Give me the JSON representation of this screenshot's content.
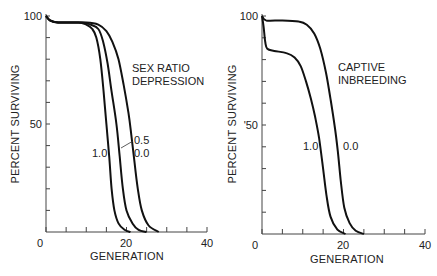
{
  "chart_data": [
    {
      "type": "line",
      "title": "SEX RATIO DEPRESSION",
      "annotation": [
        "SEX RATIO",
        "DEPRESSION"
      ],
      "xlabel": "GENERATION",
      "ylabel": "PERCENT SURVIVING",
      "xlim": [
        0,
        40
      ],
      "ylim": [
        0,
        100
      ],
      "xticks": [
        0,
        20,
        40
      ],
      "x_minor_ticks": [
        5,
        10,
        15,
        25,
        30,
        35
      ],
      "yticks": [
        50,
        100
      ],
      "y_minor_ticks": [
        10,
        20,
        30,
        40,
        60,
        70,
        80,
        90
      ],
      "grid": false,
      "series": [
        {
          "name": "1.0",
          "points": [
            [
              0,
              100
            ],
            [
              1,
              98
            ],
            [
              3,
              97
            ],
            [
              8,
              97
            ],
            [
              10,
              96
            ],
            [
              11.5,
              94
            ],
            [
              12.5,
              90
            ],
            [
              13.5,
              80
            ],
            [
              14.3,
              65
            ],
            [
              15,
              50
            ],
            [
              15.7,
              35
            ],
            [
              16.3,
              20
            ],
            [
              17,
              10
            ],
            [
              18,
              4
            ],
            [
              19.5,
              1
            ],
            [
              21,
              0
            ]
          ]
        },
        {
          "name": "0.5",
          "points": [
            [
              0,
              100
            ],
            [
              1,
              98
            ],
            [
              3,
              97
            ],
            [
              9,
              97
            ],
            [
              11,
              96
            ],
            [
              13,
              94
            ],
            [
              14.2,
              88
            ],
            [
              15.3,
              78
            ],
            [
              16.3,
              65
            ],
            [
              17.5,
              50
            ],
            [
              18.3,
              35
            ],
            [
              19.1,
              20
            ],
            [
              20,
              10
            ],
            [
              21.5,
              4
            ],
            [
              23,
              1
            ],
            [
              25,
              0
            ]
          ]
        },
        {
          "name": "0.0",
          "points": [
            [
              0,
              100
            ],
            [
              1,
              98
            ],
            [
              3,
              97
            ],
            [
              10,
              97
            ],
            [
              13,
              96
            ],
            [
              15,
              93
            ],
            [
              16.5,
              88
            ],
            [
              18,
              80
            ],
            [
              19.3,
              68
            ],
            [
              20.5,
              55
            ],
            [
              21.2,
              45
            ],
            [
              22,
              32
            ],
            [
              22.8,
              20
            ],
            [
              23.8,
              10
            ],
            [
              25.5,
              3
            ],
            [
              28,
              0
            ]
          ]
        }
      ],
      "series_labels": [
        {
          "name": "1.0",
          "label": "1.0"
        },
        {
          "name": "0.5",
          "label": "0.5"
        },
        {
          "name": "0.0",
          "label": "0.0"
        }
      ]
    },
    {
      "type": "line",
      "title": "CAPTIVE INBREEDING",
      "annotation": [
        "CAPTIVE",
        "INBREEDING"
      ],
      "xlabel": "GENERATION",
      "ylabel": "PERCENT SURVIVING",
      "xlim": [
        0,
        40
      ],
      "ylim": [
        0,
        100
      ],
      "xticks": [
        0,
        20,
        40
      ],
      "x_minor_ticks": [
        5,
        10,
        15,
        25,
        30,
        35
      ],
      "yticks": [
        50,
        100
      ],
      "ytick_labels": [
        "'50",
        "100"
      ],
      "y_minor_ticks": [
        10,
        20,
        30,
        40,
        60,
        70,
        80,
        90
      ],
      "grid": false,
      "series": [
        {
          "name": "1.0",
          "points": [
            [
              0,
              100
            ],
            [
              0.4,
              95
            ],
            [
              0.8,
              88
            ],
            [
              1.3,
              85
            ],
            [
              3,
              84
            ],
            [
              6,
              83
            ],
            [
              8,
              81
            ],
            [
              9.5,
              77
            ],
            [
              10.8,
              70
            ],
            [
              12,
              62
            ],
            [
              13,
              54
            ],
            [
              14,
              44
            ],
            [
              15,
              30
            ],
            [
              15.8,
              18
            ],
            [
              16.8,
              8
            ],
            [
              18.5,
              2
            ],
            [
              20.5,
              0
            ]
          ]
        },
        {
          "name": "0.0",
          "points": [
            [
              0,
              100
            ],
            [
              1,
              98
            ],
            [
              5,
              98
            ],
            [
              9,
              97.5
            ],
            [
              11,
              96
            ],
            [
              12.8,
              92
            ],
            [
              14.3,
              85
            ],
            [
              15.7,
              74
            ],
            [
              16.8,
              62
            ],
            [
              17.8,
              50
            ],
            [
              18.6,
              38
            ],
            [
              19.3,
              25
            ],
            [
              20.2,
              12
            ],
            [
              21.5,
              5
            ],
            [
              23,
              1.5
            ],
            [
              25,
              0
            ]
          ]
        }
      ],
      "series_labels": [
        {
          "name": "1.0",
          "label": "1.0"
        },
        {
          "name": "0.0",
          "label": "0.0"
        }
      ]
    }
  ],
  "left": {
    "ylabel": "PERCENT SURVIVING",
    "xlabel": "GENERATION",
    "y100": "100",
    "y50": "50",
    "x0": "0",
    "x20": "20",
    "x40": "40",
    "annot1": "SEX RATIO",
    "annot2": "DEPRESSION",
    "lab10": "1.0",
    "lab05": "0.5",
    "lab00": "0.0"
  },
  "right": {
    "ylabel": "PERCENT SURVIVING",
    "xlabel": "GENERATION",
    "y100": "100",
    "y50": "'50",
    "x0": "0",
    "x20": "20",
    "x40": "40",
    "annot1": "CAPTIVE",
    "annot2": "INBREEDING",
    "lab10": "1.0",
    "lab00": "0.0"
  }
}
